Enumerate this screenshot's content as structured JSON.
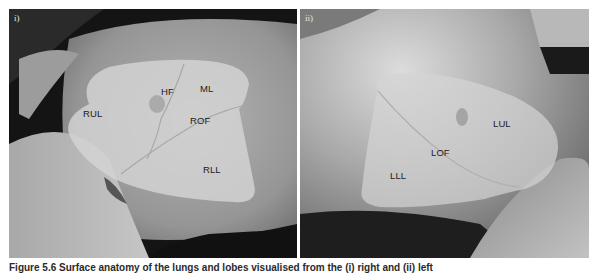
{
  "figure": {
    "caption": "Figure 5.6 Surface anatomy of the lungs and lobes visualised from the (i) right and (ii) left",
    "panels": [
      {
        "id": "i",
        "label": "i)",
        "lobes": {
          "rul": "RUL",
          "hf": "HF",
          "ml": "ML",
          "rof": "ROF",
          "rll": "RLL"
        }
      },
      {
        "id": "ii",
        "label": "ii)",
        "lobes": {
          "lul": "LUL",
          "lof": "LOF",
          "lll": "LLL"
        }
      }
    ]
  },
  "colors": {
    "overlay": "#d2d2d2",
    "skin_light": "#bdbdbd",
    "skin_mid": "#8f8f8f",
    "skin_dark": "#3a3a3a",
    "background_dark": "#141414"
  }
}
